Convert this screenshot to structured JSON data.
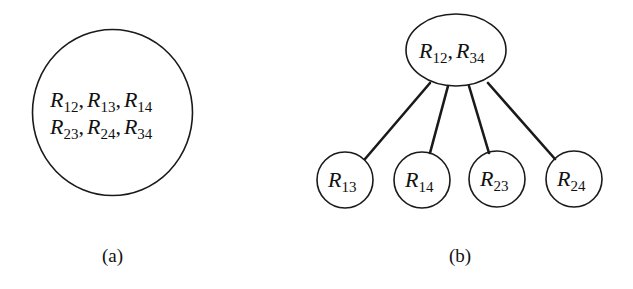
{
  "figure": {
    "panel_a": {
      "caption": "(a)",
      "node": {
        "shape": "circle",
        "rows": [
          [
            {
              "var": "R",
              "sub": "12"
            },
            {
              "var": "R",
              "sub": "13"
            },
            {
              "var": "R",
              "sub": "14"
            }
          ],
          [
            {
              "var": "R",
              "sub": "23"
            },
            {
              "var": "R",
              "sub": "24"
            },
            {
              "var": "R",
              "sub": "34"
            }
          ]
        ],
        "separator": ","
      }
    },
    "panel_b": {
      "caption": "(b)",
      "root": {
        "shape": "ellipse",
        "items": [
          {
            "var": "R",
            "sub": "12"
          },
          {
            "var": "R",
            "sub": "34"
          }
        ],
        "separator": ","
      },
      "children": [
        {
          "var": "R",
          "sub": "13"
        },
        {
          "var": "R",
          "sub": "14"
        },
        {
          "var": "R",
          "sub": "23"
        },
        {
          "var": "R",
          "sub": "24"
        }
      ]
    }
  },
  "colors": {
    "stroke": "#1a1a1a",
    "text": "#111111",
    "background": "#ffffff"
  }
}
